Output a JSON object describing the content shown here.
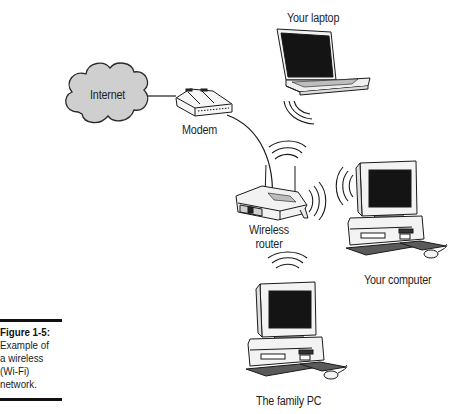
{
  "figure": {
    "number": "Figure 1-5:",
    "caption": "Example of\na wireless\n(Wi-Fi)\nnetwork."
  },
  "nodes": {
    "internet": {
      "label": "Internet",
      "icon": "cloud-icon"
    },
    "modem": {
      "label": "Modem",
      "icon": "modem-icon"
    },
    "router": {
      "label_line1": "Wireless",
      "label_line2": "router",
      "icon": "wireless-router-icon"
    },
    "laptop": {
      "label": "Your laptop",
      "icon": "laptop-icon"
    },
    "your_computer": {
      "label": "Your computer",
      "icon": "desktop-computer-icon"
    },
    "family_pc": {
      "label": "The family PC",
      "icon": "desktop-computer-icon"
    }
  },
  "connections": [
    {
      "from": "Internet",
      "to": "Modem",
      "type": "wired"
    },
    {
      "from": "Modem",
      "to": "Wireless router",
      "type": "wired"
    },
    {
      "from": "Wireless router",
      "to": "Your laptop",
      "type": "wireless"
    },
    {
      "from": "Wireless router",
      "to": "Your computer",
      "type": "wireless"
    },
    {
      "from": "Wireless router",
      "to": "The family PC",
      "type": "wireless"
    }
  ],
  "colors": {
    "cloud_fill": "#cfcfcf",
    "line": "#1a1a1a",
    "screen": "#151515",
    "device_body": "#f4f4f4"
  }
}
